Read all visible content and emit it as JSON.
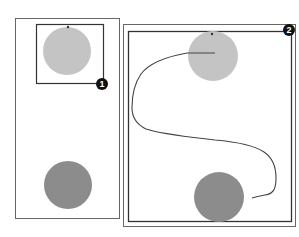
{
  "figure": {
    "colors": {
      "background": "#ffffff",
      "frame": "#555555",
      "light_circle": "#c4c4c4",
      "dark_circle": "#8c8c8c",
      "path": "#444444",
      "badge_fill": "#111111",
      "badge_text": "#ffffff"
    },
    "panels": [
      {
        "id": "panel-1",
        "badge": "1",
        "description": "Viewport frame around the top (light) circle; dark circle at bottom outside the frame"
      },
      {
        "id": "panel-2",
        "badge": "2",
        "description": "Frame enclosing both circles with a drawn S-shaped path from the light circle to the dark circle"
      }
    ]
  }
}
